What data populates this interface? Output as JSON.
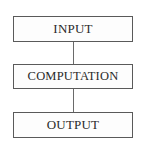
{
  "diagram": {
    "type": "flowchart",
    "direction": "top-to-bottom",
    "nodes": [
      {
        "id": "input",
        "label": "INPUT"
      },
      {
        "id": "computation",
        "label": "COMPUTATION"
      },
      {
        "id": "output",
        "label": "OUTPUT"
      }
    ],
    "edges": [
      {
        "from": "input",
        "to": "computation"
      },
      {
        "from": "computation",
        "to": "output"
      }
    ]
  }
}
